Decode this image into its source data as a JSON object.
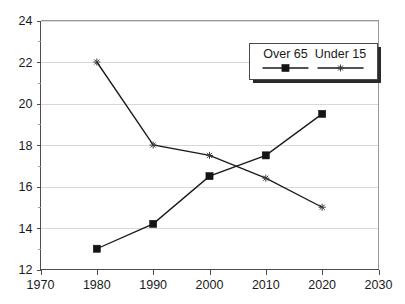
{
  "chart_data": {
    "type": "line",
    "title": "",
    "subtitle": "",
    "xlabel": "",
    "ylabel": "",
    "x": [
      1980,
      1990,
      2000,
      2010,
      2020
    ],
    "xlim": [
      1970,
      2030
    ],
    "ylim": [
      12,
      24
    ],
    "x_ticks": [
      "1970",
      "1980",
      "1990",
      "2000",
      "2010",
      "2020",
      "2030"
    ],
    "y_ticks": [
      "12",
      "14",
      "16",
      "18",
      "20",
      "22",
      "24"
    ],
    "x_tick_values": [
      1970,
      1980,
      1990,
      2000,
      2010,
      2020,
      2030
    ],
    "y_tick_values": [
      12,
      14,
      16,
      18,
      20,
      22,
      24
    ],
    "y_minor_tick_values": [
      13,
      15,
      17,
      19,
      21,
      23
    ],
    "grid": "horizontal",
    "legend_position": "top-right",
    "series": [
      {
        "name": "Over 65",
        "marker": "filled-square",
        "values": [
          13.0,
          14.2,
          16.5,
          17.5,
          19.5
        ]
      },
      {
        "name": "Under 15",
        "marker": "asterisk",
        "values": [
          22.0,
          18.0,
          17.5,
          16.4,
          15.0
        ]
      }
    ]
  },
  "legend": {
    "entries": [
      {
        "label": "Over 65"
      },
      {
        "label": "Under 15"
      }
    ]
  },
  "colors": {
    "series_over_65": "#141414",
    "series_under_15": "#3a3a3a",
    "gridline": "#d8d8d8",
    "axis": "#4d4d4d",
    "frame": "#9a9a9a",
    "background": "#ffffff"
  }
}
